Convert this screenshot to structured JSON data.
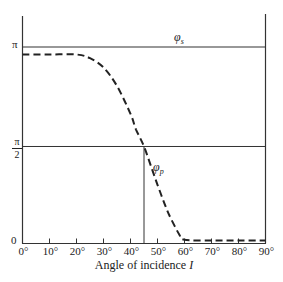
{
  "chart_data": {
    "type": "line",
    "title": "",
    "xlabel": "Angle of incidence",
    "xlabel_symbol": "I",
    "ylabel": "",
    "x_ticks": [
      "0°",
      "10°",
      "20°",
      "30°",
      "40°",
      "50°",
      "60°",
      "70°",
      "80°",
      "90°"
    ],
    "x_tick_values": [
      0,
      10,
      20,
      30,
      40,
      50,
      60,
      70,
      80,
      90
    ],
    "y_ticks": [
      "0",
      "π/2",
      "π"
    ],
    "y_tick_values": [
      0,
      1.5708,
      3.1416
    ],
    "xlim": [
      0,
      90
    ],
    "ylim": [
      0,
      3.6
    ],
    "grid": false,
    "series": [
      {
        "name": "φs",
        "style": "solid",
        "x": [
          0,
          90
        ],
        "values": [
          3.1416,
          3.1416
        ]
      },
      {
        "name": "φp",
        "style": "dashed",
        "x": [
          0,
          10,
          20,
          25,
          30,
          35,
          40,
          42,
          45,
          48,
          50,
          53,
          55,
          58,
          60,
          70,
          80,
          90
        ],
        "values": [
          3.06,
          3.06,
          3.06,
          3.0,
          2.85,
          2.55,
          2.1,
          1.85,
          1.5708,
          1.2,
          0.95,
          0.6,
          0.4,
          0.15,
          0.06,
          0.05,
          0.05,
          0.05
        ]
      }
    ],
    "reference_lines": [
      {
        "type": "horizontal",
        "y": 1.5708,
        "label": "π/2"
      },
      {
        "type": "vertical",
        "x": 45,
        "label": "Brewster angle"
      }
    ],
    "annotations": [
      "φs",
      "φp"
    ]
  },
  "labels": {
    "y_zero": "0",
    "y_pi": "π",
    "y_half_pi_num": "π",
    "y_half_pi_den": "2",
    "xlabel_text": "Angle of incidence ",
    "xlabel_symbol": "I",
    "phi_s_main": "φ",
    "phi_s_sub": "s",
    "phi_p_main": "φ",
    "phi_p_sub": "p"
  },
  "colors": {
    "line": "#222222",
    "axis": "#333333",
    "background": "#ffffff"
  }
}
